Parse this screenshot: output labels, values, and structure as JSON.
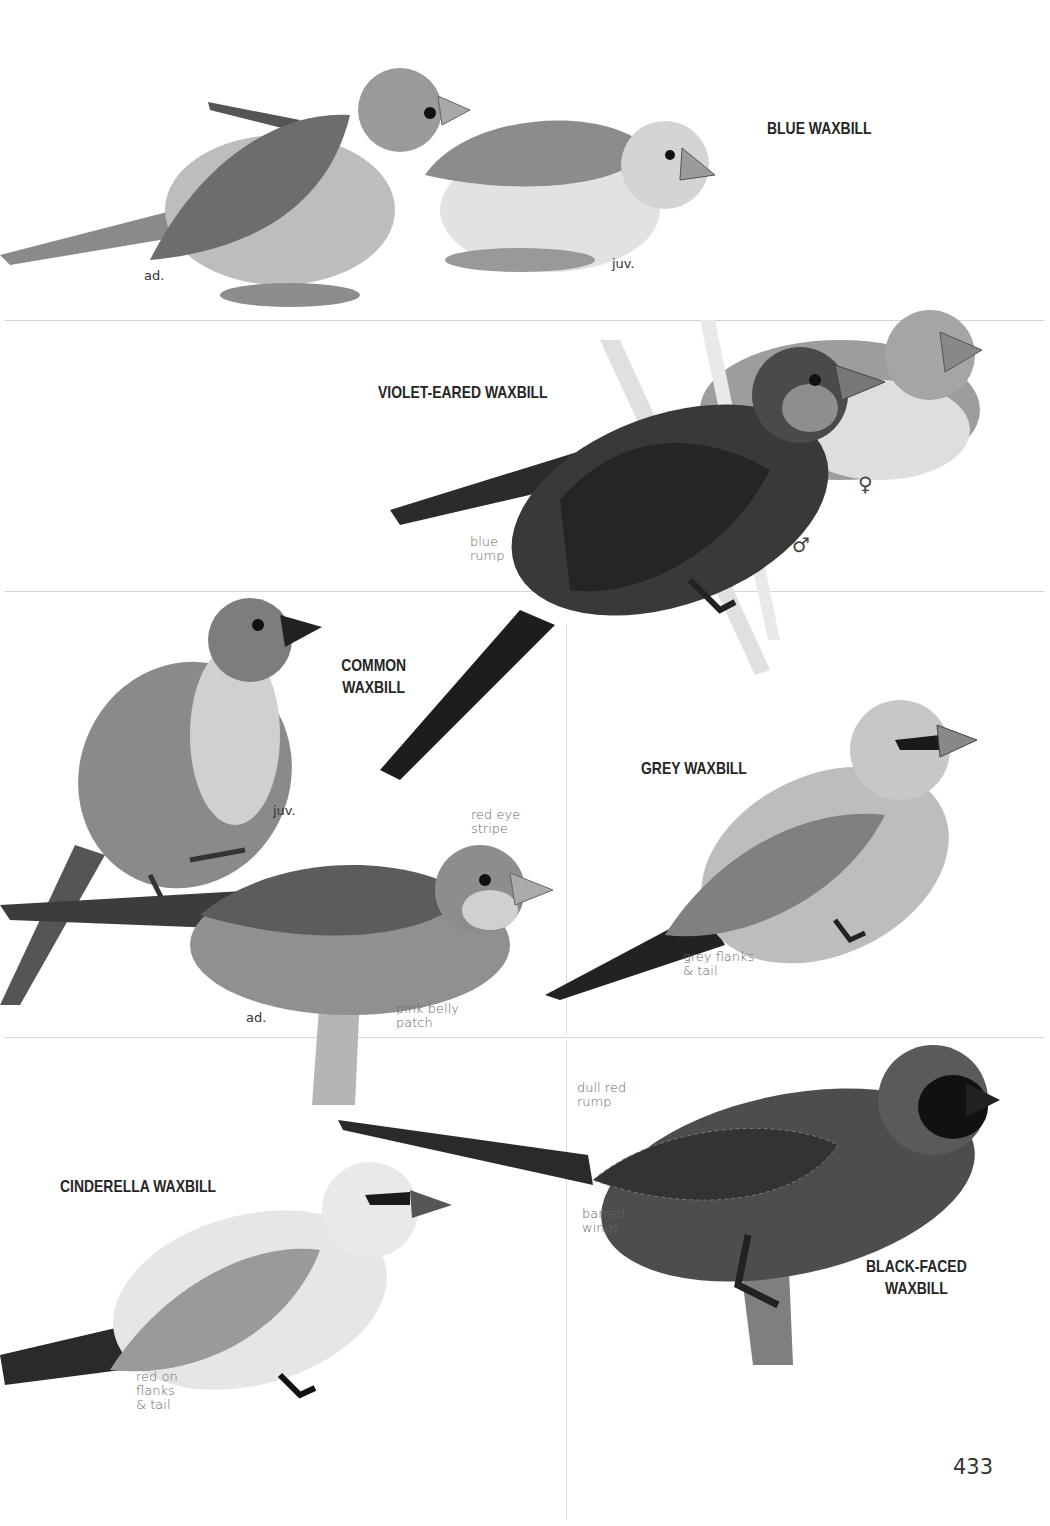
{
  "page": {
    "number": "433"
  },
  "species": {
    "blue_waxbill": {
      "title": "BLUE WAXBILL",
      "labels": {
        "adult": "ad.",
        "juvenile": "juv."
      }
    },
    "violet_eared_waxbill": {
      "title": "VIOLET-EARED WAXBILL",
      "notes": {
        "rump": "blue\nrump"
      },
      "sex": {
        "female": "♀",
        "male": "♂"
      }
    },
    "common_waxbill": {
      "title_line1": "COMMON",
      "title_line2": "WAXBILL",
      "labels": {
        "juvenile": "juv.",
        "adult": "ad."
      },
      "notes": {
        "eye": "red eye\nstripe",
        "belly": "pink belly\npatch"
      }
    },
    "grey_waxbill": {
      "title": "GREY WAXBILL",
      "notes": {
        "flanks": "grey flanks\n& tail"
      }
    },
    "cinderella_waxbill": {
      "title": "CINDERELLA WAXBILL",
      "notes": {
        "flanks": "red on\nflanks\n& tail"
      }
    },
    "black_faced_waxbill": {
      "title_line1": "BLACK-FACED",
      "title_line2": "WAXBILL",
      "notes": {
        "rump": "dull red\nrump",
        "wings": "barred\nwings"
      }
    }
  }
}
